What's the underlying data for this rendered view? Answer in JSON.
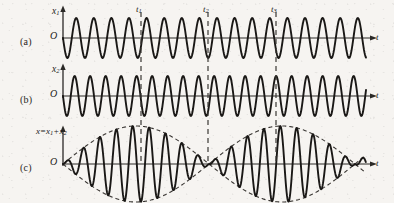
{
  "figure": {
    "background_color": "#f6f4f1",
    "curve_color": "#1a1816",
    "axis_color": "#2b2927",
    "dashed_color": "#3a3734"
  },
  "panels": [
    {
      "tag": "(a)",
      "tag_x": 20,
      "tag_y": 36,
      "y_axis_label": "x",
      "y_axis_sub": "1",
      "y_axis_label_x": 52,
      "y_axis_label_y": 6,
      "origin_label": "O",
      "origin_x": 50,
      "origin_y": 30,
      "t_label": "t",
      "t_label_x": 376,
      "t_label_y": 32,
      "baseline_y": 38,
      "amplitude": 20,
      "period_px": 17.6,
      "phase": 0
    },
    {
      "tag": "(b)",
      "tag_x": 20,
      "tag_y": 94,
      "y_axis_label": "x",
      "y_axis_sub": "2",
      "y_axis_label_x": 52,
      "y_axis_label_y": 64,
      "origin_label": "O",
      "origin_x": 50,
      "origin_y": 88,
      "t_label": "t",
      "t_label_x": 376,
      "t_label_y": 90,
      "baseline_y": 96,
      "amplitude": 20,
      "period_px": 15.5,
      "phase": 0
    },
    {
      "tag": "(c)",
      "tag_x": 20,
      "tag_y": 162,
      "sum_label_lhs": "x",
      "sum_label_op1": "=",
      "sum_label_a": "x",
      "sum_label_a_sub": "1",
      "sum_label_op2": "+",
      "sum_label_b": "x",
      "sum_label_b_sub": "2",
      "sum_label_x": 36,
      "sum_label_y": 126,
      "origin_label": "O",
      "origin_x": 50,
      "origin_y": 156,
      "t_label": "t",
      "t_label_x": 376,
      "t_label_y": 158,
      "baseline_y": 164,
      "amplitude": 38,
      "period_px": 16.4,
      "beat_period_px": 146,
      "beat_node_offset": 0
    }
  ],
  "time_markers": [
    {
      "label": "t",
      "sub": "1",
      "x": 141,
      "label_x": 136,
      "label_y": 4
    },
    {
      "label": "t",
      "sub": "2",
      "x": 208,
      "label_x": 203,
      "label_y": 4
    },
    {
      "label": "t",
      "sub": "3",
      "x": 276,
      "label_x": 271,
      "label_y": 4
    }
  ],
  "geometry": {
    "y_axis_x": 63,
    "plot_right_x": 366,
    "arrow_tip_x": 372,
    "panel_a_axis_top": 10,
    "panel_b_axis_top": 68,
    "panel_c_axis_top": 130,
    "dash_top": 12,
    "dash_bottom": 164
  },
  "annotations": {
    "description": "Panels (a) and (b) show two sinusoids of slightly different frequency; panel (c) shows their sum with a dashed beat envelope. t1 and t3 fall at envelope antinodes, t2 at an envelope node."
  }
}
